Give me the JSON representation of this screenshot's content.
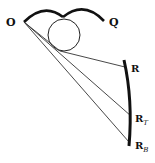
{
  "diagram": {
    "labels": {
      "O": "O",
      "Q": "Q",
      "R": "R",
      "RT_main": "R",
      "RT_sub": "T",
      "RB_main": "R",
      "RB_sub": "B"
    },
    "colors": {
      "stroke": "#111111",
      "thin_line": "#333333",
      "background": "#ffffff"
    }
  }
}
